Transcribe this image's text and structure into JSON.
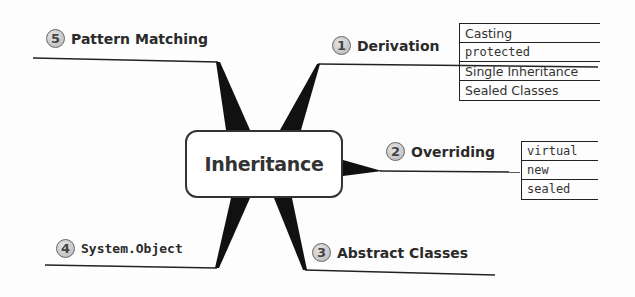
{
  "diagram": {
    "center": {
      "label": "Inheritance"
    },
    "branches": [
      {
        "number": "1",
        "label": "Derivation",
        "monospace": false,
        "children": [
          {
            "label": "Casting",
            "code": false
          },
          {
            "label": "protected",
            "code": true
          },
          {
            "label": "Single Inheritance",
            "code": false
          },
          {
            "label": "Sealed Classes",
            "code": false
          }
        ]
      },
      {
        "number": "2",
        "label": "Overriding",
        "monospace": false,
        "children": [
          {
            "label": "virtual",
            "code": true
          },
          {
            "label": "new",
            "code": true
          },
          {
            "label": "sealed",
            "code": true
          }
        ]
      },
      {
        "number": "3",
        "label": "Abstract Classes",
        "monospace": false,
        "children": []
      },
      {
        "number": "4",
        "label": "System.Object",
        "monospace": true,
        "children": []
      },
      {
        "number": "5",
        "label": "Pattern Matching",
        "monospace": false,
        "children": []
      }
    ]
  }
}
